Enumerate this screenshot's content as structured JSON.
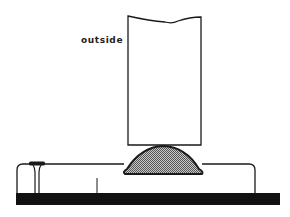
{
  "diagram": {
    "labels": {
      "outside": "outside"
    },
    "colors": {
      "stroke": "#1a1a1a",
      "fill_dome": "#9a9a9a",
      "base_bar": "#111111",
      "background": "#ffffff"
    },
    "components": [
      "upright-panel",
      "bead-dome",
      "left-horizontal-surface",
      "right-horizontal-surface",
      "nail",
      "base-bar",
      "small-tick"
    ]
  }
}
